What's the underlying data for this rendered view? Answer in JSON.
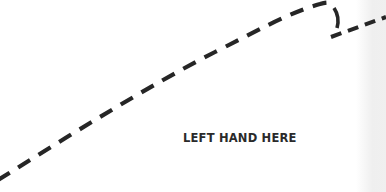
{
  "document": {
    "instruction_label": "LEFT HAND HERE",
    "outline": {
      "style": "dashed",
      "stroke_color": "#262626",
      "description": "hand tracing outline"
    },
    "colors": {
      "background": "#ffffff",
      "text": "#2a2a2a",
      "stroke": "#262626"
    }
  }
}
